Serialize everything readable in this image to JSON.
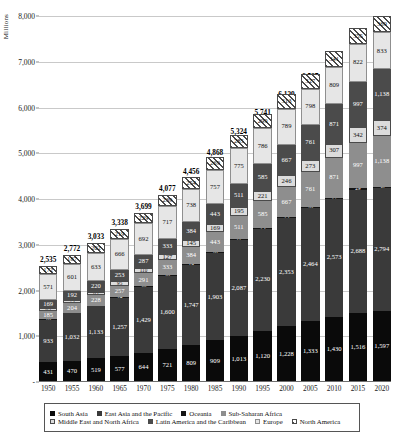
{
  "chart_data": {
    "type": "bar",
    "stacked": true,
    "title": "",
    "subtitle": "",
    "xlabel": "",
    "ylabel": "Millions",
    "ylim": [
      0,
      8000
    ],
    "yticks": [
      0,
      1000,
      2000,
      3000,
      4000,
      5000,
      6000,
      7000,
      8000
    ],
    "ytick_labels": [
      "-",
      "1,000",
      "2,000",
      "3,000",
      "4,000",
      "5,000",
      "6,000",
      "7,000",
      "8,000"
    ],
    "grid": true,
    "legend_position": "bottom",
    "categories": [
      "1950",
      "1955",
      "1960",
      "1965",
      "1970",
      "1975",
      "1980",
      "1985",
      "1990",
      "1995",
      "2000",
      "2005",
      "2010",
      "2015",
      "2020"
    ],
    "totals": [
      2535,
      2772,
      3033,
      3338,
      3699,
      4077,
      4456,
      4868,
      5324,
      5741,
      6139,
      6537,
      6952,
      7374,
      7789
    ],
    "total_labels": [
      "2,535",
      "2,772",
      "3,033",
      "3,338",
      "3,699",
      "4,077",
      "4,456",
      "4,868",
      "5,324",
      "5,741",
      "6,139",
      "6,537",
      "6,952",
      "7,374",
      "7,789"
    ],
    "series": [
      {
        "name": "South Asia",
        "key": "south",
        "values": [
          431,
          470,
          519,
          577,
          644,
          721,
          809,
          909,
          1013,
          1120,
          1228,
          1333,
          1430,
          1516,
          1597
        ],
        "labels": [
          "431",
          "470",
          "519",
          "577",
          "644",
          "721",
          "809",
          "909",
          "1,013",
          "1,120",
          "1,228",
          "1,333",
          "1,430",
          "1,516",
          "1,597"
        ]
      },
      {
        "name": "East Asia and the Pacific",
        "key": "eap",
        "values": [
          933,
          1032,
          1133,
          1257,
          1429,
          1600,
          1747,
          1903,
          2087,
          2230,
          2353,
          2464,
          2573,
          2688,
          2794
        ],
        "labels": [
          "933",
          "1,032",
          "1,133",
          "1,257",
          "1,429",
          "1,600",
          "1,747",
          "1,903",
          "2,087",
          "2,230",
          "2,353",
          "2,464",
          "2,573",
          "2,688",
          "2,794"
        ]
      },
      {
        "name": "Oceania",
        "key": "oce",
        "values": [
          10,
          11,
          13,
          14,
          16,
          18,
          19,
          20,
          22,
          23,
          25,
          26,
          27,
          29,
          30
        ],
        "labels": [
          "10",
          "11",
          "13",
          "14",
          "16",
          "18",
          "19",
          "20",
          "22",
          "23",
          "25",
          "26",
          "27",
          "29",
          "30"
        ]
      },
      {
        "name": "Sub-Saharan Africa",
        "key": "ssa",
        "values": [
          185,
          204,
          228,
          257,
          291,
          333,
          384,
          443,
          511,
          585,
          667,
          761,
          871,
          997,
          1138
        ],
        "labels": [
          "185",
          "204",
          "228",
          "257",
          "291",
          "333",
          "384",
          "443",
          "511",
          "585",
          "667",
          "761",
          "871",
          "997",
          "1,138"
        ]
      },
      {
        "name": "Middle East and North Africa",
        "key": "mena",
        "values": [
          65,
          75,
          85,
          95,
          110,
          127,
          145,
          169,
          195,
          221,
          246,
          273,
          307,
          342,
          374
        ],
        "labels": [
          "65",
          "75",
          "85",
          "95",
          "110",
          "127",
          "145",
          "169",
          "195",
          "221",
          "246",
          "273",
          "307",
          "342",
          "374"
        ]
      },
      {
        "name": "Latin America and the Caribbean",
        "key": "lac",
        "values": [
          169,
          192,
          220,
          253,
          287,
          333,
          384,
          443,
          511,
          585,
          667,
          761,
          871,
          997,
          1138
        ],
        "labels": [
          "169",
          "192",
          "220",
          "253",
          "287",
          "333",
          "384",
          "443",
          "511",
          "585",
          "667",
          "761",
          "871",
          "997",
          "1,138"
        ]
      },
      {
        "name": "Europe",
        "key": "eur",
        "values": [
          571,
          601,
          633,
          666,
          692,
          717,
          738,
          757,
          775,
          786,
          789,
          798,
          809,
          822,
          833
        ],
        "labels": [
          "571",
          "601",
          "633",
          "666",
          "692",
          "717",
          "738",
          "757",
          "775",
          "786",
          "789",
          "798",
          "809",
          "822",
          "833"
        ]
      },
      {
        "name": "North America",
        "key": "na",
        "values": [
          172,
          187,
          202,
          219,
          229,
          239,
          254,
          269,
          285,
          299,
          313,
          327,
          341,
          355,
          369
        ],
        "labels": [
          "172",
          "187",
          "202",
          "219",
          "229",
          "239",
          "254",
          "269",
          "285",
          "299",
          "313",
          "327",
          "341",
          "355",
          "369"
        ]
      }
    ]
  },
  "legend": {
    "rows": [
      [
        {
          "label": "South Asia",
          "key": "south"
        },
        {
          "label": "East Asia and the Pacific",
          "key": "eap"
        },
        {
          "label": "Oceania",
          "key": "oce"
        },
        {
          "label": "Sub-Saharan Africa",
          "key": "ssa"
        }
      ],
      [
        {
          "label": "Middle East and North Africa",
          "key": "mena"
        },
        {
          "label": "Latin America and the Caribbean",
          "key": "lac"
        },
        {
          "label": "Europe",
          "key": "eur"
        },
        {
          "label": "North America",
          "key": "na"
        }
      ]
    ]
  }
}
